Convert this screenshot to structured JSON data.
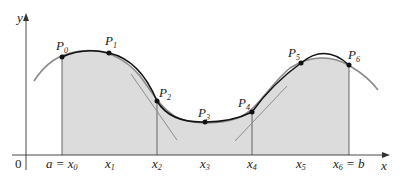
{
  "figure": {
    "axes": {
      "x_label": "x",
      "y_label": "y",
      "origin_label": "0"
    },
    "points": [
      {
        "name": "P",
        "sub": "0",
        "x": 62,
        "y": 57
      },
      {
        "name": "P",
        "sub": "1",
        "x": 109,
        "y": 53
      },
      {
        "name": "P",
        "sub": "2",
        "x": 157,
        "y": 101
      },
      {
        "name": "P",
        "sub": "3",
        "x": 205,
        "y": 122
      },
      {
        "name": "P",
        "sub": "4",
        "x": 252,
        "y": 112
      },
      {
        "name": "P",
        "sub": "5",
        "x": 301,
        "y": 63
      },
      {
        "name": "P",
        "sub": "6",
        "x": 349,
        "y": 65
      }
    ],
    "tick_labels": [
      {
        "pre": "a = ",
        "var": "x",
        "sub": "0",
        "post": ""
      },
      {
        "pre": "",
        "var": "x",
        "sub": "1",
        "post": ""
      },
      {
        "pre": "",
        "var": "x",
        "sub": "2",
        "post": ""
      },
      {
        "pre": "",
        "var": "x",
        "sub": "3",
        "post": ""
      },
      {
        "pre": "",
        "var": "x",
        "sub": "4",
        "post": ""
      },
      {
        "pre": "",
        "var": "x",
        "sub": "5",
        "post": ""
      },
      {
        "pre": "",
        "var": "x",
        "sub": "6",
        "post": " = b"
      }
    ],
    "colors": {
      "shading": "#dcdcdc",
      "curve_gray": "#8c8c8c",
      "curve_black": "#111111",
      "axis": "#333333"
    }
  }
}
